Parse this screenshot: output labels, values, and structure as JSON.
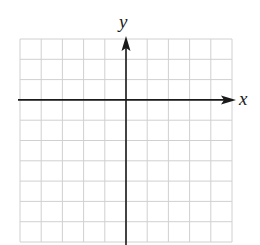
{
  "diagram": {
    "type": "coordinate-grid",
    "title": "",
    "axes": {
      "x_label": "x",
      "y_label": "y"
    },
    "grid": {
      "columns": 10,
      "rows": 10,
      "columns_left_of_y_axis": 5,
      "rows_above_x_axis": 3,
      "tick_labels": "none"
    },
    "colors": {
      "grid_line": "#d0d0d0",
      "axis_line": "#1a1a1a",
      "background": "#ffffff"
    }
  }
}
